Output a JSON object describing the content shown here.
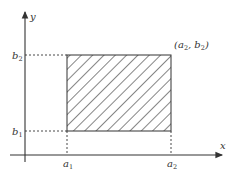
{
  "diagram": {
    "title": "",
    "axes": {
      "x_label": "x",
      "y_label": "y"
    },
    "rectangle": {
      "fill": "hatched",
      "corner_label": {
        "text": "(a",
        "sub1": "2",
        "mid": ", b",
        "sub2": "2",
        "end": ")"
      }
    },
    "ticks": {
      "a1": {
        "base": "a",
        "sub": "1"
      },
      "a2": {
        "base": "a",
        "sub": "2"
      },
      "b1": {
        "base": "b",
        "sub": "1"
      },
      "b2": {
        "base": "b",
        "sub": "2"
      }
    },
    "colors": {
      "line": "#333333",
      "background": "#ffffff"
    }
  }
}
